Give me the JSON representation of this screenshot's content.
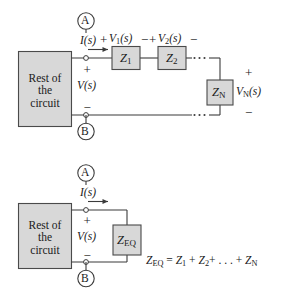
{
  "figure": {
    "type": "circuit-diagram",
    "colors": {
      "line": "#3b3b3b",
      "box_fill": "#d8d8d8",
      "box_stroke": "#4a4a4a",
      "text": "#1a1a1a",
      "background": "#ffffff"
    }
  },
  "top_circuit": {
    "source_box": {
      "line1": "Rest of",
      "line2": "the",
      "line3": "circuit"
    },
    "terminal_a": "A",
    "terminal_b": "B",
    "current_label": "I(s)",
    "current_label_italic_part": "I",
    "current_label_arg": "(s)",
    "source_voltage": "V(s)",
    "source_plus": "+",
    "source_minus": "−",
    "drops": [
      {
        "plus": "+",
        "label": "V",
        "sub": "1",
        "arg": "(s)",
        "minus": "−"
      },
      {
        "plus": "+",
        "label": "V",
        "sub": "2",
        "arg": "(s)",
        "minus": "−"
      }
    ],
    "impedances": [
      {
        "label": "Z",
        "sub": "1",
        "name": "impedance-z1"
      },
      {
        "label": "Z",
        "sub": "2",
        "name": "impedance-z2"
      },
      {
        "label": "Z",
        "sub": "N",
        "name": "impedance-zn"
      }
    ],
    "ellipsis": ". . .",
    "vn": {
      "plus": "+",
      "label": "V",
      "sub": "N",
      "arg": "(s)",
      "minus": "−"
    }
  },
  "bottom_circuit": {
    "source_box": {
      "line1": "Rest of",
      "line2": "the",
      "line3": "circuit"
    },
    "terminal_a": "A",
    "terminal_b": "B",
    "current_label": "I(s)",
    "source_voltage": "V(s)",
    "source_plus": "+",
    "source_minus": "−",
    "equivalent_impedance": {
      "label": "Z",
      "sub": "EQ"
    },
    "equation": {
      "lhs_label": "Z",
      "lhs_sub": "EQ",
      "equals": "=",
      "term1_label": "Z",
      "term1_sub": "1",
      "plus1": "+",
      "term2_label": "Z",
      "term2_sub": "2",
      "plus2": "+",
      "ellipsis": ". . .",
      "plus3": "+",
      "termN_label": "Z",
      "termN_sub": "N",
      "full_text": "Z_EQ = Z_1 + Z_2 + . . . + Z_N"
    }
  }
}
